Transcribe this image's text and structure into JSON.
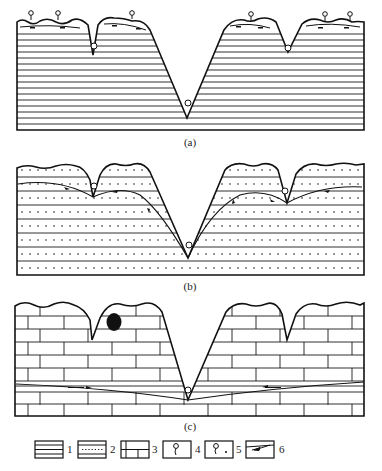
{
  "panels": [
    {
      "id": "a",
      "caption": "(a)",
      "pattern": "horizontal-strata",
      "description": "Layered (non-karst) rock with springs on hilltops and in valleys"
    },
    {
      "id": "b",
      "caption": "(b)",
      "pattern": "sandstone-dotted-strata",
      "description": "Dotted layered rock with groundwater flow lines toward valley springs"
    },
    {
      "id": "c",
      "caption": "(c)",
      "pattern": "limestone-brick",
      "description": "Limestone with karst cave and deep groundwater flow to main valley spring"
    }
  ],
  "legend": {
    "items": [
      {
        "num": "1",
        "symbol": "horizontal-strata"
      },
      {
        "num": "2",
        "symbol": "dotted-strata"
      },
      {
        "num": "3",
        "symbol": "limestone-brick"
      },
      {
        "num": "4",
        "symbol": "spring-type-1"
      },
      {
        "num": "5",
        "symbol": "spring-type-2"
      },
      {
        "num": "6",
        "symbol": "flow-arrow"
      }
    ]
  },
  "colors": {
    "ink": "#1a1a1a",
    "paper": "#ffffff"
  }
}
